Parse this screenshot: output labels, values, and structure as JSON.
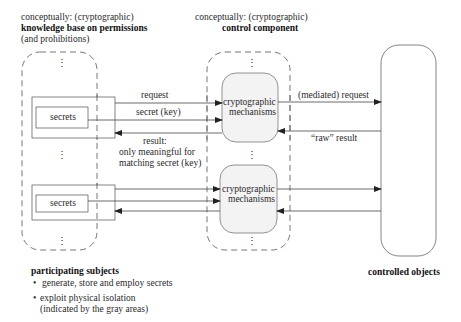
{
  "left_header": {
    "line1": "conceptually: (cryptographic)",
    "line2": "knowledge base on permissions",
    "line3": "(and prohibitions)"
  },
  "middle_header": {
    "line1": "conceptually: (cryptographic)",
    "line2": "control component"
  },
  "subjects": {
    "secrets_label_1": "secrets",
    "secrets_label_2": "secrets",
    "ellipsis": "⋮"
  },
  "mechanisms": {
    "box1_line1": "cryptographic",
    "box1_line2": "mechanisms",
    "box2_line1": "cryptographic",
    "box2_line2": "mechanisms"
  },
  "arrows": {
    "request": "request",
    "secret_key": "secret (key)",
    "result_line1": "result:",
    "result_line2": "only meaningful for",
    "result_line3": "matching secret (key)",
    "mediated_request": "(mediated) request",
    "raw_result": "“raw” result"
  },
  "footer_left": {
    "title": "participating subjects",
    "bullet1": "generate, store and employ secrets",
    "bullet2_line1": "exploit physical isolation",
    "bullet2_line2": "(indicated by the gray areas)",
    "bullet_char": "•"
  },
  "footer_right": {
    "title": "controlled objects"
  },
  "colors": {
    "line": "#555555",
    "gray_fill": "#f3f3f3",
    "dash": "#666666"
  }
}
